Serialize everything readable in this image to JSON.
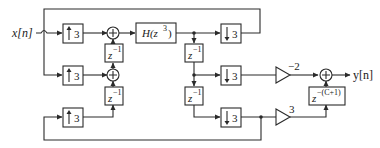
{
  "diagram": {
    "type": "multirate signal flow diagram",
    "input_label": "x[n]",
    "output_label": "y[n]",
    "upsamplers": [
      {
        "id": "up1",
        "factor": "3",
        "symbol": "↑"
      },
      {
        "id": "up2",
        "factor": "3",
        "symbol": "↑"
      },
      {
        "id": "up3",
        "factor": "3",
        "symbol": "↑"
      }
    ],
    "downsamplers": [
      {
        "id": "down1",
        "factor": "3",
        "symbol": "↓"
      },
      {
        "id": "down2",
        "factor": "3",
        "symbol": "↓"
      },
      {
        "id": "down3",
        "factor": "3",
        "symbol": "↓"
      }
    ],
    "delays": [
      {
        "id": "d_left_top",
        "label_base": "z",
        "label_exp": "−1"
      },
      {
        "id": "d_left_bottom",
        "label_base": "z",
        "label_exp": "−1"
      },
      {
        "id": "d_right_top",
        "label_base": "z",
        "label_exp": "−1"
      },
      {
        "id": "d_right_bottom",
        "label_base": "z",
        "label_exp": "−1"
      },
      {
        "id": "d_output",
        "label_base": "z",
        "label_exp": "−(C+1)"
      }
    ],
    "filter": {
      "label_prefix": "H(z",
      "label_exp": "3",
      "label_suffix": ")"
    },
    "gains": [
      {
        "id": "gain_minus2",
        "value": "−2"
      },
      {
        "id": "gain_3",
        "value": "3"
      }
    ],
    "adders": [
      {
        "id": "add1",
        "symbol": "+"
      },
      {
        "id": "add2",
        "symbol": "+"
      },
      {
        "id": "add_out",
        "symbol": "+"
      }
    ]
  }
}
